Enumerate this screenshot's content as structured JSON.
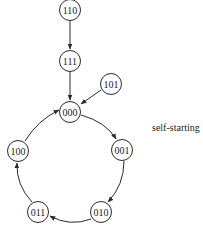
{
  "diagram": {
    "type": "state-diagram",
    "title": "",
    "note": "self-starting",
    "nodes": [
      {
        "id": "110",
        "label": "110",
        "x": 70,
        "y": 10
      },
      {
        "id": "111",
        "label": "111",
        "x": 70,
        "y": 61
      },
      {
        "id": "101",
        "label": "101",
        "x": 111,
        "y": 84
      },
      {
        "id": "000",
        "label": "000",
        "x": 70,
        "y": 112
      },
      {
        "id": "001",
        "label": "001",
        "x": 122,
        "y": 150
      },
      {
        "id": "010",
        "label": "010",
        "x": 101,
        "y": 212
      },
      {
        "id": "011",
        "label": "011",
        "x": 38,
        "y": 212
      },
      {
        "id": "100",
        "label": "100",
        "x": 18,
        "y": 151
      }
    ],
    "edges": [
      {
        "from": "110",
        "to": "111"
      },
      {
        "from": "111",
        "to": "000"
      },
      {
        "from": "101",
        "to": "000"
      },
      {
        "from": "000",
        "to": "001"
      },
      {
        "from": "001",
        "to": "010"
      },
      {
        "from": "010",
        "to": "011"
      },
      {
        "from": "011",
        "to": "100"
      },
      {
        "from": "100",
        "to": "000"
      }
    ],
    "colors": {
      "stroke": "#2a2a2a",
      "text": "#1a1a1a",
      "background": "#ffffff"
    }
  }
}
